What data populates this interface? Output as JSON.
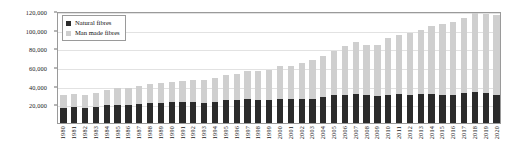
{
  "chart_data": {
    "type": "bar",
    "subtype": "stacked-vertical-bar",
    "title": "",
    "subtitle": "",
    "xlabel": "",
    "ylabel": "",
    "ylim": [
      0,
      120000
    ],
    "ytick_values": [
      0,
      20000,
      40000,
      60000,
      80000,
      100000,
      120000
    ],
    "ytick_labels": [
      "0",
      "20,000",
      "40,000",
      "60,000",
      "80,000",
      "100,000",
      "120,000"
    ],
    "ytick_labels_shown": [
      "20,000",
      "40,000",
      "60,000",
      "80,000",
      "100,000",
      "120,000"
    ],
    "grid": true,
    "grid_axis": "y",
    "legend_position": "upper-left-inside",
    "categories": [
      "1980",
      "1981",
      "1982",
      "1983",
      "1984",
      "1985",
      "1986",
      "1987",
      "1988",
      "1989",
      "1990",
      "1991",
      "1992",
      "1993",
      "1994",
      "1995",
      "1996",
      "1997",
      "1998",
      "1999",
      "2000",
      "2001",
      "2002",
      "2003",
      "2004",
      "2005",
      "2006",
      "2007",
      "2008",
      "2009",
      "2010",
      "2011",
      "2012",
      "2013",
      "2014",
      "2015",
      "2016",
      "2017",
      "2018",
      "2019",
      "2020"
    ],
    "series": [
      {
        "name": "Natural fibres",
        "color": "#2b2b2b",
        "values": [
          16500,
          16800,
          16200,
          17000,
          19500,
          19800,
          19200,
          20500,
          21500,
          21800,
          22500,
          23000,
          22200,
          21500,
          23000,
          24500,
          24800,
          25200,
          24800,
          24500,
          25500,
          25800,
          25200,
          25800,
          28000,
          29500,
          30500,
          31500,
          29500,
          28500,
          30500,
          31500,
          30500,
          31000,
          31500,
          30500,
          30000,
          32000,
          33000,
          32500,
          30500
        ]
      },
      {
        "name": "Man made fibres",
        "color": "#cfcfcf",
        "values": [
          13500,
          14200,
          14300,
          15500,
          16000,
          17200,
          18300,
          19500,
          20500,
          21200,
          21500,
          22500,
          23800,
          24500,
          25500,
          26500,
          28200,
          30300,
          30700,
          32500,
          35500,
          35200,
          38800,
          41200,
          44000,
          47500,
          51500,
          55500,
          54500,
          55500,
          60500,
          62500,
          65500,
          69000,
          72500,
          75500,
          78000,
          81000,
          85000,
          84500,
          85500
        ]
      }
    ],
    "totals": [
      30000,
      31000,
      30500,
      32500,
      35500,
      37000,
      37500,
      40000,
      42000,
      43000,
      44000,
      45500,
      46000,
      46000,
      48500,
      51000,
      53000,
      55500,
      55500,
      57000,
      61000,
      61000,
      64000,
      67000,
      72000,
      77000,
      82000,
      87000,
      84000,
      84000,
      91000,
      94000,
      96000,
      100000,
      104000,
      106000,
      108000,
      113000,
      118000,
      117000,
      116000
    ]
  },
  "legend": {
    "items": [
      {
        "label": "Natural fibres",
        "color": "#2b2b2b"
      },
      {
        "label": "Man made fibres",
        "color": "#cfcfcf"
      }
    ]
  },
  "colors": {
    "natural_fibres": "#2b2b2b",
    "man_made_fibres": "#cfcfcf",
    "axis": "#9a9a9a",
    "gridline": "#e2e2e2",
    "text": "#1a1a1a",
    "background": "#ffffff"
  }
}
